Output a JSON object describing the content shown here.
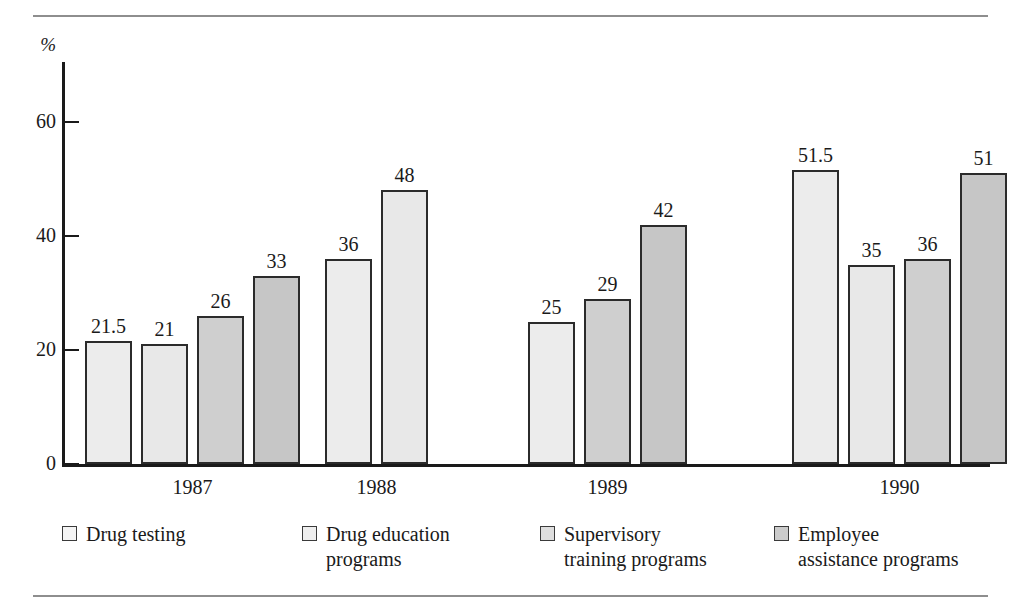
{
  "chart_data": {
    "type": "bar",
    "title": "",
    "subtitle": "",
    "xlabel": "",
    "ylabel": "%",
    "ylim": [
      0,
      60
    ],
    "yticks": [
      0,
      20,
      40,
      60
    ],
    "ytick_labels": [
      "0",
      "20",
      "40",
      "60"
    ],
    "grid": false,
    "legend_position": "bottom",
    "categories": [
      "1987",
      "1988",
      "1989",
      "1990"
    ],
    "series": [
      {
        "name": "Drug testing",
        "values": [
          21.5,
          36,
          25,
          51.5
        ],
        "swatch": "s0",
        "color": "#ececec"
      },
      {
        "name": "Drug education programs",
        "values": [
          21,
          48,
          29,
          35
        ],
        "swatch": "s1",
        "color": "#e8e8e8"
      },
      {
        "name": "Supervisory training programs",
        "values": [
          26,
          null,
          42,
          36
        ],
        "swatch": "s2",
        "color": "#cfcfcf"
      },
      {
        "name": "Employee assistance programs",
        "values": [
          33,
          null,
          null,
          51
        ],
        "swatch": "s3",
        "color": "#c6c6c6"
      }
    ],
    "bars": [
      {
        "group": "1987",
        "series": "Drug testing",
        "value": 21.5,
        "label": "21.5",
        "swatch": "s0"
      },
      {
        "group": "1987",
        "series": "Drug education programs",
        "value": 21,
        "label": "21",
        "swatch": "s1"
      },
      {
        "group": "1987",
        "series": "Supervisory training programs",
        "value": 26,
        "label": "26",
        "swatch": "s2"
      },
      {
        "group": "1987",
        "series": "Employee assistance programs",
        "value": 33,
        "label": "33",
        "swatch": "s3"
      },
      {
        "group": "1988",
        "series": "Drug testing",
        "value": 36,
        "label": "36",
        "swatch": "s0"
      },
      {
        "group": "1988",
        "series": "Drug education programs",
        "value": 48,
        "label": "48",
        "swatch": "s1"
      },
      {
        "group": "1989",
        "series": "Drug testing",
        "value": 25,
        "label": "25",
        "swatch": "s0"
      },
      {
        "group": "1989",
        "series": "Supervisory training programs",
        "value": 29,
        "label": "29",
        "swatch": "s2"
      },
      {
        "group": "1989",
        "series": "Employee assistance programs",
        "value": 42,
        "label": "42",
        "swatch": "s3"
      },
      {
        "group": "1990",
        "series": "Drug testing",
        "value": 51.5,
        "label": "51.5",
        "swatch": "s0"
      },
      {
        "group": "1990",
        "series": "Drug education programs",
        "value": 35,
        "label": "35",
        "swatch": "s1"
      },
      {
        "group": "1990",
        "series": "Supervisory training programs",
        "value": 36,
        "label": "36",
        "swatch": "s2"
      },
      {
        "group": "1990",
        "series": "Employee assistance programs",
        "value": 51,
        "label": "51",
        "swatch": "s3"
      }
    ]
  },
  "axis": {
    "unit_label": "%",
    "ticks": [
      "60",
      "40",
      "20",
      "0"
    ]
  },
  "year_labels": [
    "1987",
    "1988",
    "1989",
    "1990"
  ],
  "legend": {
    "items": [
      {
        "label": "Drug testing",
        "swatch": "s0"
      },
      {
        "label": "Drug education\nprograms",
        "swatch": "s1"
      },
      {
        "label": "Supervisory\ntraining programs",
        "swatch": "s2"
      },
      {
        "label": "Employee\nassistance programs",
        "swatch": "s3"
      }
    ]
  },
  "colors": {
    "series_1": "#ececec",
    "series_2": "#e8e8e8",
    "series_3": "#cfcfcf",
    "series_4": "#c6c6c6",
    "axis": "#1a1a1a",
    "rule": "#8e8e8e",
    "background": "#ffffff"
  }
}
